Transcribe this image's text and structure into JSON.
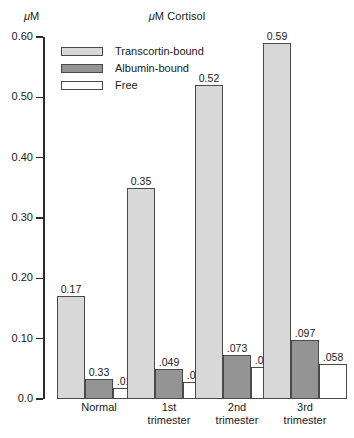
{
  "chart_data": {
    "type": "bar",
    "title": "μM Cortisol",
    "xlabel": "",
    "ylabel": "μM",
    "ylim": [
      0.0,
      0.6
    ],
    "yticks": [
      "0.0",
      "0.10",
      "0.20",
      "0.30",
      "0.40",
      "0.50",
      "0.60"
    ],
    "ytick_values": [
      0.0,
      0.1,
      0.2,
      0.3,
      0.4,
      0.5,
      0.6
    ],
    "grid": false,
    "legend_position": "upper-left-inside",
    "categories": [
      "Normal",
      "1st trimester",
      "2nd trimester",
      "3rd trimester"
    ],
    "series": [
      {
        "name": "Transcortin-bound",
        "color": "#d8d8d8",
        "values": [
          0.17,
          0.35,
          0.52,
          0.59
        ],
        "labels": [
          "0.17",
          "0.35",
          "0.52",
          "0.59"
        ]
      },
      {
        "name": "Albumin-bound",
        "color": "#949494",
        "values": [
          0.033,
          0.049,
          0.073,
          0.097
        ],
        "labels": [
          "0.33",
          ".049",
          ".073",
          ".097"
        ]
      },
      {
        "name": "Free",
        "color": "#ffffff",
        "values": [
          0.018,
          0.029,
          0.053,
          0.058
        ],
        "labels": [
          ".018",
          ".029",
          ".053",
          ".058"
        ]
      }
    ]
  },
  "axis": {
    "y_label": "μM",
    "tick_labels": [
      "0.60",
      "0.50",
      "0.40",
      "0.30",
      "0.20",
      "0.10",
      "0.0"
    ]
  },
  "legend": {
    "items": [
      {
        "label": "Transcortin-bound",
        "swatch": "transcortin"
      },
      {
        "label": "Albumin-bound",
        "swatch": "albumin"
      },
      {
        "label": "Free",
        "swatch": "free"
      }
    ]
  },
  "groups": [
    {
      "label_line1": "Normal",
      "label_line2": "",
      "bars": [
        {
          "series": "Transcortin-bound",
          "label": "0.17",
          "value": 0.17
        },
        {
          "series": "Albumin-bound",
          "label": "0.33",
          "value": 0.033
        },
        {
          "series": "Free",
          "label": ".018",
          "value": 0.018
        }
      ]
    },
    {
      "label_line1": "1st",
      "label_line2": "trimester",
      "bars": [
        {
          "series": "Transcortin-bound",
          "label": "0.35",
          "value": 0.35
        },
        {
          "series": "Albumin-bound",
          "label": ".049",
          "value": 0.049
        },
        {
          "series": "Free",
          "label": ".029",
          "value": 0.029
        }
      ]
    },
    {
      "label_line1": "2nd",
      "label_line2": "trimester",
      "bars": [
        {
          "series": "Transcortin-bound",
          "label": "0.52",
          "value": 0.52
        },
        {
          "series": "Albumin-bound",
          "label": ".073",
          "value": 0.073
        },
        {
          "series": "Free",
          "label": ".053",
          "value": 0.053
        }
      ]
    },
    {
      "label_line1": "3rd",
      "label_line2": "trimester",
      "bars": [
        {
          "series": "Transcortin-bound",
          "label": "0.59",
          "value": 0.59
        },
        {
          "series": "Albumin-bound",
          "label": ".097",
          "value": 0.097
        },
        {
          "series": "Free",
          "label": ".058",
          "value": 0.058
        }
      ]
    }
  ],
  "colors": {
    "transcortin": "#d8d8d8",
    "albumin": "#949494",
    "free": "#ffffff",
    "axis": "#2a2a2a",
    "outline": "#4a4a4a"
  }
}
